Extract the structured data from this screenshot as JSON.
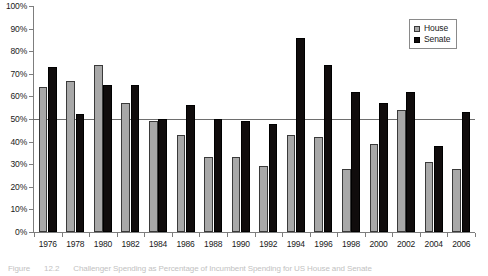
{
  "chart_data": {
    "type": "bar",
    "title": "",
    "xlabel": "",
    "ylabel": "",
    "ylim": [
      0,
      100
    ],
    "yticks": [
      0,
      10,
      20,
      30,
      40,
      50,
      60,
      70,
      80,
      90,
      100
    ],
    "ytick_labels": [
      "0%",
      "10%",
      "20%",
      "30%",
      "40%",
      "50%",
      "60%",
      "70%",
      "80%",
      "90%",
      "100%"
    ],
    "grid": false,
    "legend_position": "top-right",
    "reference_line": 50,
    "categories": [
      1976,
      1978,
      1980,
      1982,
      1984,
      1986,
      1988,
      1990,
      1992,
      1994,
      1996,
      1998,
      2000,
      2002,
      2004,
      2006
    ],
    "series": [
      {
        "name": "House",
        "color": "#a8a8a8",
        "values": [
          64,
          67,
          74,
          57,
          49,
          43,
          33,
          33,
          29,
          43,
          42,
          28,
          39,
          54,
          31,
          28
        ]
      },
      {
        "name": "Senate",
        "color": "#100c0c",
        "values": [
          73,
          52,
          65,
          65,
          50,
          56,
          50,
          49,
          48,
          86,
          74,
          62,
          57,
          62,
          38,
          53
        ]
      }
    ]
  },
  "legend": {
    "items": [
      {
        "label": "House",
        "swatch": "house"
      },
      {
        "label": "Senate",
        "swatch": "senate"
      }
    ]
  },
  "caption": {
    "label": "Figure",
    "number": "12.2",
    "text": "Challenger Spending as Percentage of Incumbent Spending for US House and Senate"
  }
}
